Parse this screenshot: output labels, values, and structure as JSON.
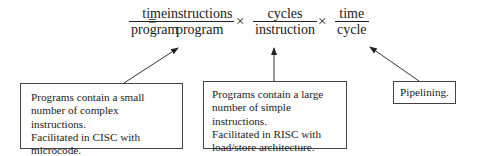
{
  "equation": {
    "lhs": {
      "numerator": "time",
      "denominator": "program"
    },
    "equals": "=",
    "terms": [
      {
        "numerator": "instructions",
        "denominator": "program"
      },
      {
        "numerator": "cycles",
        "denominator": "instruction"
      },
      {
        "numerator": "time",
        "denominator": "cycle"
      }
    ],
    "times": "×"
  },
  "annotations": [
    {
      "id": "cisc",
      "lines": [
        "Programs contain a small",
        "number of complex instructions.",
        "Facilitated in CISC with",
        "microcode."
      ]
    },
    {
      "id": "risc",
      "lines": [
        "Programs contain a large",
        "number of simple instructions.",
        "Facilitated in RISC with",
        "load/store architecture."
      ]
    },
    {
      "id": "pipelining",
      "lines": [
        "Pipelining."
      ]
    }
  ]
}
